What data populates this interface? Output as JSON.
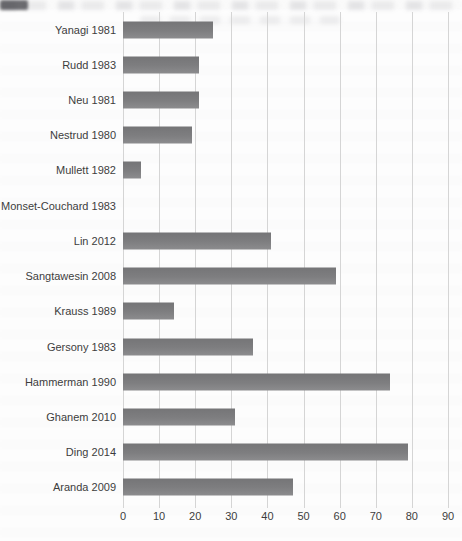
{
  "chart_data": {
    "type": "bar",
    "orientation": "horizontal",
    "title": "",
    "xlabel": "",
    "ylabel": "",
    "categories": [
      "Yanagi 1981",
      "Rudd 1983",
      "Neu 1981",
      "Nestrud 1980",
      "Mullett 1982",
      "Monset-Couchard 1983",
      "Lin 2012",
      "Sangtawesin 2008",
      "Krauss 1989",
      "Gersony 1983",
      "Hammerman 1990",
      "Ghanem 2010",
      "Ding 2014",
      "Aranda 2009"
    ],
    "values": [
      25,
      21,
      21,
      19,
      5,
      0,
      41,
      59,
      14,
      36,
      74,
      31,
      79,
      47
    ],
    "xlim": [
      0,
      90
    ],
    "x_ticks": [
      0,
      10,
      20,
      30,
      40,
      50,
      60,
      70,
      80,
      90
    ],
    "grid": true,
    "legend": "none",
    "bar_color": "#7d7d7d",
    "gridline_color": "#d5d5d5",
    "label_color": "#3d3d3d"
  }
}
